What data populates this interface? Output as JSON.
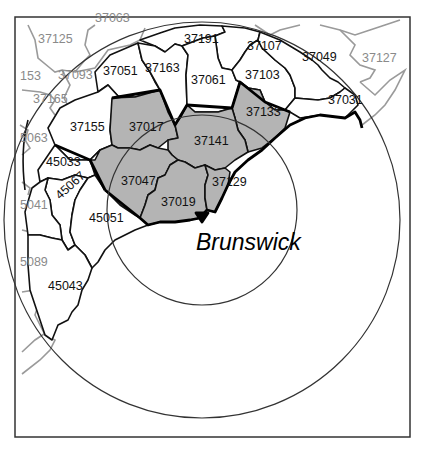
{
  "map": {
    "site_label": "Brunswick",
    "rings": [
      {
        "name": "inner-ring",
        "cx": 202,
        "cy": 220,
        "r": 95
      },
      {
        "name": "outer-ring",
        "cx": 202,
        "cy": 220,
        "r": 200
      }
    ],
    "colors": {
      "shaded": "#b4b4b4",
      "unshaded": "#ffffff",
      "outside_border": "#9a9a9a",
      "border": "#111111"
    },
    "shaded_counties": [
      "37017",
      "37141",
      "37133",
      "37047",
      "37019",
      "37129"
    ],
    "labels": [
      {
        "code": "37125",
        "x": 38,
        "y": 43,
        "style": "grey"
      },
      {
        "code": "37063",
        "x": 95,
        "y": 22,
        "style": "grey"
      },
      {
        "code": "153",
        "x": 20,
        "y": 80,
        "style": "grey"
      },
      {
        "code": "37093",
        "x": 58,
        "y": 79,
        "style": "grey"
      },
      {
        "code": "37165",
        "x": 33,
        "y": 103,
        "style": "grey"
      },
      {
        "code": "5063",
        "x": 20,
        "y": 142,
        "style": "grey"
      },
      {
        "code": "5041",
        "x": 20,
        "y": 209,
        "style": "grey"
      },
      {
        "code": "5089",
        "x": 20,
        "y": 266,
        "style": "grey"
      },
      {
        "code": "37127",
        "x": 362,
        "y": 62,
        "style": "grey"
      },
      {
        "code": "37191",
        "x": 184,
        "y": 43,
        "style": "black"
      },
      {
        "code": "37107",
        "x": 247,
        "y": 50,
        "style": "black"
      },
      {
        "code": "37049",
        "x": 302,
        "y": 61,
        "style": "black"
      },
      {
        "code": "37051",
        "x": 103,
        "y": 75,
        "style": "black"
      },
      {
        "code": "37163",
        "x": 145,
        "y": 72,
        "style": "black"
      },
      {
        "code": "37061",
        "x": 191,
        "y": 84,
        "style": "black"
      },
      {
        "code": "37103",
        "x": 245,
        "y": 79,
        "style": "black"
      },
      {
        "code": "37031",
        "x": 328,
        "y": 104,
        "style": "black"
      },
      {
        "code": "37155",
        "x": 70,
        "y": 131,
        "style": "black"
      },
      {
        "code": "37017",
        "x": 129,
        "y": 131,
        "style": "black"
      },
      {
        "code": "37133",
        "x": 246,
        "y": 116,
        "style": "black"
      },
      {
        "code": "37141",
        "x": 194,
        "y": 145,
        "style": "black"
      },
      {
        "code": "45033",
        "x": 46,
        "y": 166,
        "style": "black"
      },
      {
        "code": "37047",
        "x": 121,
        "y": 185,
        "style": "black"
      },
      {
        "code": "37129",
        "x": 212,
        "y": 186,
        "style": "black"
      },
      {
        "code": "45051",
        "x": 89,
        "y": 222,
        "style": "black"
      },
      {
        "code": "37019",
        "x": 161,
        "y": 206,
        "style": "black"
      },
      {
        "code": "45043",
        "x": 48,
        "y": 290,
        "style": "black"
      }
    ],
    "rotated_labels": [
      {
        "code": "45067",
        "x": 60,
        "y": 200,
        "angle": -42,
        "style": "black"
      }
    ]
  }
}
